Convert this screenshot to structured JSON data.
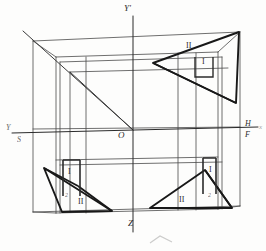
{
  "figure": {
    "type": "technical-line-diagram",
    "colors": {
      "ink": "#2b2b2b",
      "thin_line": "#555555",
      "thick_line": "#1e1e1e",
      "background": "#fdfdfc"
    }
  },
  "axes": {
    "vertical_top_label": "Y'",
    "vertical_bottom_label": "Z",
    "origin_label": "O",
    "left_upper_label": "Y",
    "left_lower_label": "S",
    "right_upper_label": "H",
    "right_lower_label": "F",
    "right_far_label": "x"
  },
  "annotations": [
    {
      "id": "tr-ii",
      "text": "II",
      "corner": "top-right",
      "x": 186,
      "y": 47
    },
    {
      "id": "tr-i",
      "text": "I",
      "corner": "top-right",
      "x": 201,
      "y": 62
    },
    {
      "id": "bl-i",
      "text": "I",
      "corner": "bottom-left",
      "x": 68,
      "y": 172
    },
    {
      "id": "bl-sub",
      "text": "2",
      "corner": "bottom-left",
      "x": 66,
      "y": 196
    },
    {
      "id": "bl-ii",
      "text": "II",
      "corner": "bottom-left",
      "x": 78,
      "y": 202
    },
    {
      "id": "br-i",
      "text": "I",
      "corner": "bottom-right",
      "x": 209,
      "y": 170
    },
    {
      "id": "br-sub",
      "text": "2",
      "corner": "bottom-right",
      "x": 209,
      "y": 196
    },
    {
      "id": "br-ii",
      "text": "II",
      "corner": "bottom-right",
      "x": 179,
      "y": 200
    }
  ]
}
